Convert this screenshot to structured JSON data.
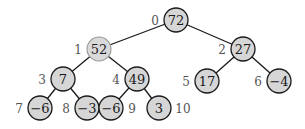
{
  "diagram": {
    "type": "binary-heap-tree",
    "node_radius": 12,
    "colors": {
      "node_fill": "#d6d6d6",
      "node_stroke": "#1a1a1a",
      "highlight_stroke": "#9a9a9a",
      "index_label": "#555555",
      "edge": "#1a1a1a"
    },
    "nodes": [
      {
        "index": "0",
        "value": "72",
        "x": 176,
        "y": 20,
        "label_side": "left",
        "highlight": false
      },
      {
        "index": "1",
        "value": "52",
        "x": 99,
        "y": 49,
        "label_side": "left",
        "highlight": true
      },
      {
        "index": "2",
        "value": "27",
        "x": 243,
        "y": 49,
        "label_side": "left",
        "highlight": false
      },
      {
        "index": "3",
        "value": "7",
        "x": 63,
        "y": 79,
        "label_side": "left",
        "highlight": false
      },
      {
        "index": "4",
        "value": "49",
        "x": 137,
        "y": 79,
        "label_side": "left",
        "highlight": false
      },
      {
        "index": "5",
        "value": "17",
        "x": 207,
        "y": 81,
        "label_side": "left",
        "highlight": false
      },
      {
        "index": "6",
        "value": "−4",
        "x": 279,
        "y": 81,
        "label_side": "left",
        "highlight": false
      },
      {
        "index": "7",
        "value": "−6",
        "x": 40,
        "y": 108,
        "label_side": "left",
        "highlight": false
      },
      {
        "index": "8",
        "value": "−3",
        "x": 87,
        "y": 108,
        "label_side": "left",
        "highlight": false
      },
      {
        "index": "9",
        "value": "−6",
        "x": 111,
        "y": 108,
        "label_side": "right",
        "highlight": false
      },
      {
        "index": "10",
        "value": "3",
        "x": 159,
        "y": 108,
        "label_side": "right",
        "highlight": false
      }
    ],
    "edges": [
      [
        0,
        1
      ],
      [
        0,
        2
      ],
      [
        1,
        3
      ],
      [
        1,
        4
      ],
      [
        2,
        5
      ],
      [
        2,
        6
      ],
      [
        3,
        7
      ],
      [
        3,
        8
      ],
      [
        4,
        9
      ],
      [
        4,
        10
      ]
    ]
  }
}
